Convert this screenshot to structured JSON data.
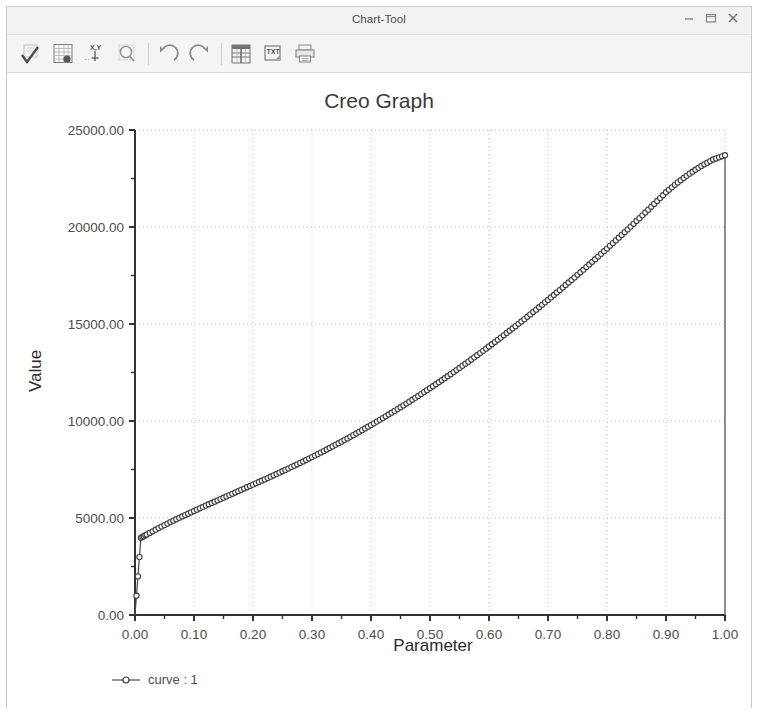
{
  "window": {
    "title": "Chart-Tool",
    "controls": [
      {
        "name": "minimize",
        "label": "–"
      },
      {
        "name": "maximize",
        "label": "❐"
      },
      {
        "name": "close",
        "label": "✕"
      }
    ]
  },
  "toolbar": {
    "buttons": [
      {
        "name": "accept-checkmark-icon",
        "tooltip": "Accept"
      },
      {
        "name": "data-table-icon",
        "tooltip": "Data Table"
      },
      {
        "name": "xy-axes-icon",
        "tooltip": "XY Axes"
      },
      {
        "name": "zoom-icon",
        "tooltip": "Zoom"
      },
      {
        "name": "undo-icon",
        "tooltip": "Undo"
      },
      {
        "name": "redo-icon",
        "tooltip": "Redo"
      },
      {
        "name": "spreadsheet-export-icon",
        "tooltip": "Export to Spreadsheet"
      },
      {
        "name": "text-export-icon",
        "tooltip": "Export as TXT"
      },
      {
        "name": "print-icon",
        "tooltip": "Print"
      }
    ]
  },
  "chart_data": {
    "type": "line",
    "title": "Creo Graph",
    "xlabel": "Parameter",
    "ylabel": "Value",
    "xlim": [
      0.0,
      1.0
    ],
    "ylim": [
      0.0,
      25000.0
    ],
    "grid": true,
    "legend_position": "bottom-left",
    "x_ticks": [
      "0.00",
      "0.10",
      "0.20",
      "0.30",
      "0.40",
      "0.50",
      "0.60",
      "0.70",
      "0.80",
      "0.90",
      "1.00"
    ],
    "x_tick_values": [
      0.0,
      0.1,
      0.2,
      0.3,
      0.4,
      0.5,
      0.6,
      0.7,
      0.8,
      0.9,
      1.0
    ],
    "x_minor_step": 0.05,
    "y_ticks": [
      "0.00",
      "5000.00",
      "10000.00",
      "15000.00",
      "20000.00",
      "25000.00"
    ],
    "y_tick_values": [
      0,
      5000,
      10000,
      15000,
      20000,
      25000
    ],
    "y_minor_step": 2500,
    "series": [
      {
        "name": "curve : 1",
        "marker": "circle",
        "color": "#3d3d3d",
        "x": [
          0.0,
          0.01,
          0.02,
          0.04,
          0.06,
          0.08,
          0.1,
          0.12,
          0.14,
          0.16,
          0.18,
          0.2,
          0.22,
          0.24,
          0.26,
          0.28,
          0.3,
          0.32,
          0.34,
          0.36,
          0.38,
          0.4,
          0.42,
          0.44,
          0.46,
          0.48,
          0.5,
          0.52,
          0.54,
          0.56,
          0.58,
          0.6,
          0.62,
          0.64,
          0.66,
          0.68,
          0.7,
          0.72,
          0.74,
          0.76,
          0.78,
          0.8,
          0.82,
          0.84,
          0.86,
          0.88,
          0.9,
          0.92,
          0.94,
          0.96,
          0.98,
          1.0,
          1.0
        ],
        "y": [
          0,
          3980,
          4150,
          4480,
          4790,
          5080,
          5360,
          5640,
          5910,
          6180,
          6450,
          6720,
          6990,
          7270,
          7550,
          7840,
          8140,
          8450,
          8770,
          9100,
          9440,
          9790,
          10150,
          10520,
          10900,
          11290,
          11690,
          12100,
          12520,
          12950,
          13390,
          13840,
          14300,
          14770,
          15250,
          15740,
          16240,
          16750,
          17270,
          17800,
          18340,
          18890,
          19450,
          20020,
          20600,
          21190,
          21790,
          22300,
          22750,
          23150,
          23480,
          23700,
          0
        ]
      }
    ]
  },
  "legend": {
    "entries": [
      {
        "label": "curve : 1",
        "marker": "circle"
      }
    ]
  }
}
